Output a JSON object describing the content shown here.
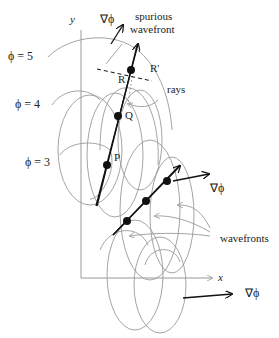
{
  "diagram": {
    "axes": {
      "x_label": "x",
      "y_label": "y"
    },
    "level_labels": [
      "ϕ = 5",
      "ϕ = 4",
      "ϕ = 3"
    ],
    "points": [
      "R",
      "R'",
      "Q",
      "P"
    ],
    "gradient_labels": [
      "∇ϕ",
      "∇ϕ",
      "∇ϕ"
    ],
    "annotations": {
      "spurious_line1": "spurious",
      "spurious_line2": "wavefront",
      "rays": "rays",
      "wavefronts": "wavefronts"
    },
    "colors": {
      "curves": "#9a9a9a",
      "lines": "#111111",
      "axes": "#999999"
    }
  }
}
